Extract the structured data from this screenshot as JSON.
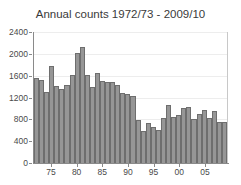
{
  "chart_data": {
    "type": "bar",
    "title": "Annual counts 1972/73 - 2009/10",
    "xlabel": "",
    "ylabel": "",
    "ylim": [
      0,
      2400
    ],
    "yticks": [
      0,
      400,
      800,
      1200,
      1600,
      2000,
      2400
    ],
    "ytick_labels": [
      "0",
      "400",
      "800",
      "1200",
      "1600",
      "2000",
      "2400"
    ],
    "xtick_labels": [
      "75",
      "80",
      "85",
      "90",
      "95",
      "00",
      "05"
    ],
    "xtick_categories": [
      "1975/76",
      "1980/81",
      "1985/86",
      "1990/91",
      "1995/96",
      "2000/01",
      "2005/06"
    ],
    "grid": true,
    "legend": null,
    "bar_color": "#969696",
    "bar_edge_color": "#6e6e6e",
    "categories": [
      "1972/73",
      "1973/74",
      "1974/75",
      "1975/76",
      "1976/77",
      "1977/78",
      "1978/79",
      "1979/80",
      "1980/81",
      "1981/82",
      "1982/83",
      "1983/84",
      "1984/85",
      "1985/86",
      "1986/87",
      "1987/88",
      "1988/89",
      "1989/90",
      "1990/91",
      "1991/92",
      "1992/93",
      "1993/94",
      "1994/95",
      "1995/96",
      "1996/97",
      "1997/98",
      "1998/99",
      "1999/00",
      "2000/01",
      "2001/02",
      "2002/03",
      "2003/04",
      "2004/05",
      "2005/06",
      "2006/07",
      "2007/08",
      "2008/09",
      "2009/10"
    ],
    "values": [
      1550,
      1520,
      1300,
      1780,
      1420,
      1350,
      1430,
      1620,
      2010,
      2120,
      1610,
      1400,
      1640,
      1500,
      1480,
      1490,
      1430,
      1280,
      1260,
      1220,
      790,
      590,
      730,
      660,
      610,
      830,
      1070,
      850,
      880,
      1000,
      1020,
      800,
      890,
      970,
      830,
      950,
      760,
      750
    ]
  }
}
